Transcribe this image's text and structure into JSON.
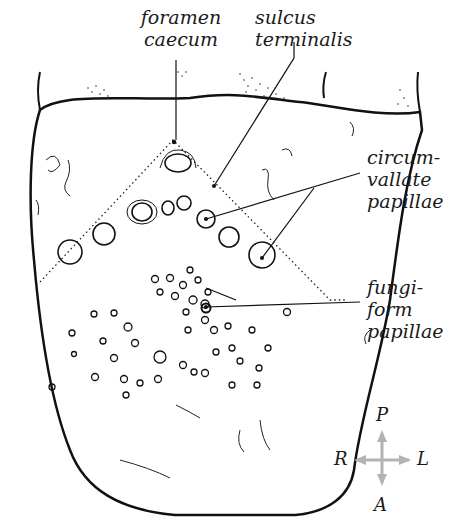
{
  "diagram": {
    "labels": {
      "foramen_caecum": [
        "foramen",
        "caecum"
      ],
      "sulcus_terminalis": [
        "sulcus",
        "terminalis"
      ],
      "circumvallate_papillae": [
        "circum-",
        "vallate",
        "papillae"
      ],
      "fungiform_papillae": [
        "fungi-",
        "form",
        "papillae"
      ]
    },
    "orientation": {
      "posterior": "P",
      "anterior": "A",
      "right": "R",
      "left": "L",
      "arrow_color": "#b3b3b3"
    },
    "colors": {
      "line": "#111111",
      "background": "#ffffff"
    }
  }
}
